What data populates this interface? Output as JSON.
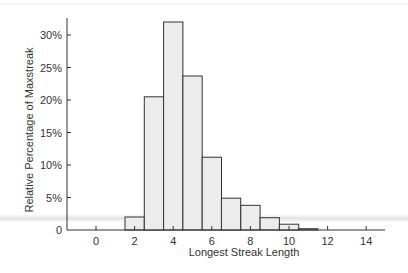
{
  "chart_data": {
    "type": "bar",
    "title": "",
    "xlabel": "Longest Streak Length",
    "ylabel": "Relative Percentage of Maxstreak",
    "categories": [
      2,
      3,
      4,
      5,
      6,
      7,
      8,
      9,
      10,
      11
    ],
    "values": [
      2.0,
      20.5,
      32.0,
      23.7,
      11.2,
      4.9,
      3.8,
      1.9,
      0.9,
      0.2
    ],
    "x_ticks": [
      "0",
      "2",
      "4",
      "6",
      "8",
      "10",
      "12",
      "14"
    ],
    "y_ticks": [
      "0",
      "5%",
      "10%",
      "15%",
      "20%",
      "25%",
      "30%"
    ],
    "xlim": [
      -1,
      15.5
    ],
    "ylim": [
      0,
      33
    ],
    "grid": false,
    "legend": null,
    "bar_fill": "#ececec",
    "bar_edge": "#333333"
  }
}
